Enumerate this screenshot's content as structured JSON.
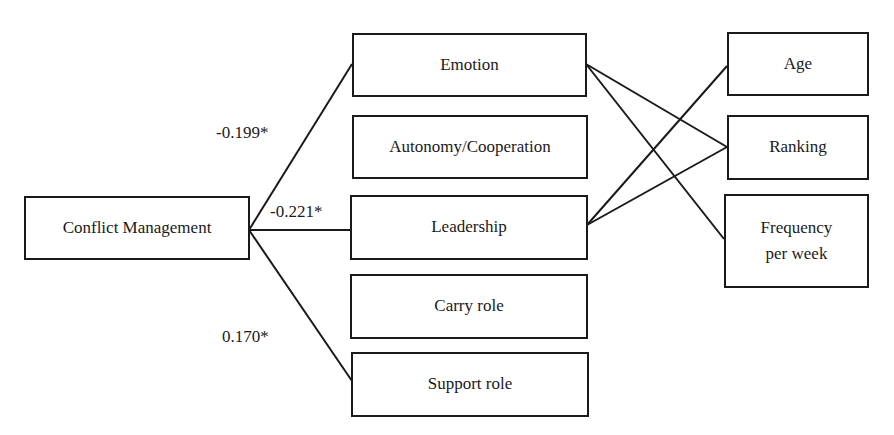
{
  "diagram": {
    "type": "path-diagram",
    "nodes": {
      "conflict_management": {
        "label": "Conflict Management"
      },
      "emotion": {
        "label": "Emotion"
      },
      "autonomy_cooperation": {
        "label": "Autonomy/Cooperation"
      },
      "leadership": {
        "label": "Leadership"
      },
      "carry_role": {
        "label": "Carry role"
      },
      "support_role": {
        "label": "Support role"
      },
      "age": {
        "label": "Age"
      },
      "ranking": {
        "label": "Ranking"
      },
      "frequency_per_week": {
        "label": "Frequency per week"
      }
    },
    "edges": [
      {
        "from": "conflict_management",
        "to": "emotion",
        "label": "-0.199*"
      },
      {
        "from": "conflict_management",
        "to": "leadership",
        "label": "-0.221*"
      },
      {
        "from": "conflict_management",
        "to": "support_role",
        "label": "0.170*"
      },
      {
        "from": "emotion",
        "to": "ranking",
        "label": ""
      },
      {
        "from": "emotion",
        "to": "frequency_per_week",
        "label": ""
      },
      {
        "from": "leadership",
        "to": "age",
        "label": ""
      },
      {
        "from": "leadership",
        "to": "ranking",
        "label": ""
      }
    ],
    "coefficients": {
      "emotion": "-0.199*",
      "leadership": "-0.221*",
      "support_role": "0.170*"
    },
    "colors": {
      "line": "#1a1a1a",
      "background": "#ffffff"
    }
  }
}
